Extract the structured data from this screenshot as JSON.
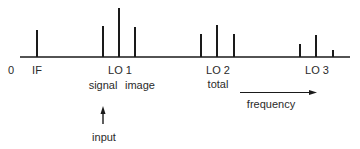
{
  "diagram": {
    "type": "frequency-spectrum",
    "axis": {
      "origin_label": "0",
      "direction_label": "frequency"
    },
    "markers": [
      {
        "id": "if",
        "label": "IF"
      },
      {
        "id": "lo1",
        "label": "LO 1"
      },
      {
        "id": "lo2",
        "label": "LO 2"
      },
      {
        "id": "lo3",
        "label": "LO 3"
      }
    ],
    "annotations": {
      "signal": "signal",
      "image": "image",
      "total": "total",
      "input": "input"
    },
    "lines": [
      {
        "group": "IF",
        "x": 37,
        "top": 30
      },
      {
        "group": "LO 1",
        "x": 103,
        "top": 26
      },
      {
        "group": "LO 1",
        "x": 119,
        "top": 8
      },
      {
        "group": "LO 1",
        "x": 135,
        "top": 27
      },
      {
        "group": "LO 2",
        "x": 201,
        "top": 34
      },
      {
        "group": "LO 2",
        "x": 217,
        "top": 25
      },
      {
        "group": "LO 2",
        "x": 234,
        "top": 34
      },
      {
        "group": "LO 3",
        "x": 300,
        "top": 44
      },
      {
        "group": "LO 3",
        "x": 316,
        "top": 35
      },
      {
        "group": "LO 3",
        "x": 333,
        "top": 50
      }
    ],
    "colors": {
      "ink": "#1a1a1a",
      "background": "#ffffff"
    }
  }
}
